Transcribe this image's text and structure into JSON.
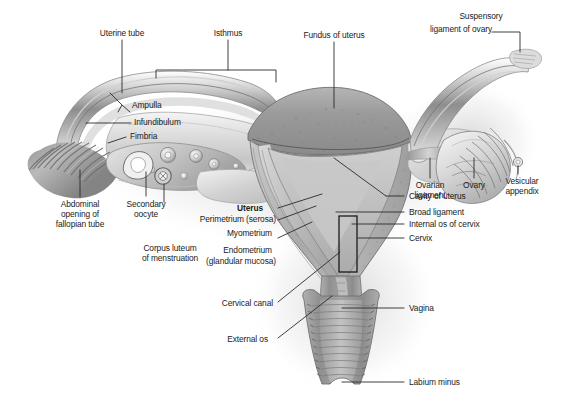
{
  "figure": {
    "background_color": "#ffffff",
    "text_color": "#1b1b1b",
    "leader_line_color": "#2a2a2a",
    "width": 563,
    "height": 401
  },
  "labels": {
    "uterine_tube": "Uterine tube",
    "isthmus": "Isthmus",
    "fundus_of_uterus": "Fundus of uterus",
    "suspensory_ligament_of_ovary_l1": "Suspensory",
    "suspensory_ligament_of_ovary_l2": "ligament of ovary",
    "ampulla": "Ampulla",
    "infundibulum": "Infundibulum",
    "fimbria": "Fimbria",
    "ovarian_ligament_l1": "Ovarian",
    "ovarian_ligament_l2": "ligament",
    "ovary": "Ovary",
    "vesicular_appendix_l1": "Vesicular",
    "vesicular_appendix_l2": "appendix",
    "abdominal_opening_l1": "Abdominal",
    "abdominal_opening_l2": "opening of",
    "abdominal_opening_l3": "fallopian tube",
    "secondary_oocyte_l1": "Secondary",
    "secondary_oocyte_l2": "oocyte",
    "corpus_luteum_l1": "Corpus luteum",
    "corpus_luteum_l2": "of menstruation",
    "uterus": "Uterus",
    "perimetrium": "Perimetrium (serosa)",
    "myometrium": "Myometrium",
    "endometrium_l1": "Endometrium",
    "endometrium_l2": "(glandular mucosa)",
    "cavity_of_uterus": "Cavity of uterus",
    "broad_ligament": "Broad ligament",
    "internal_os_of_cervix": "Internal os of cervix",
    "cervix": "Cervix",
    "cervical_canal": "Cervical canal",
    "external_os": "External os",
    "vagina": "Vagina",
    "labium_minus": "Labium minus"
  },
  "structures": [
    {
      "name": "left-fallopian-tube",
      "label_ref": "uterine_tube"
    },
    {
      "name": "left-tube-isthmus",
      "label_ref": "isthmus"
    },
    {
      "name": "uterine-fundus",
      "label_ref": "fundus_of_uterus"
    },
    {
      "name": "suspensory-ligament-of-ovary",
      "label_ref": "suspensory_ligament_of_ovary_l1"
    },
    {
      "name": "ampulla-of-tube",
      "label_ref": "ampulla"
    },
    {
      "name": "infundibulum-of-tube",
      "label_ref": "infundibulum"
    },
    {
      "name": "fimbriae",
      "label_ref": "fimbria"
    },
    {
      "name": "ovarian-ligament",
      "label_ref": "ovarian_ligament_l1"
    },
    {
      "name": "right-ovary",
      "label_ref": "ovary"
    },
    {
      "name": "vesicular-appendix",
      "label_ref": "vesicular_appendix_l1"
    },
    {
      "name": "abdominal-opening-of-fallopian-tube",
      "label_ref": "abdominal_opening_l1"
    },
    {
      "name": "secondary-oocyte",
      "label_ref": "secondary_oocyte_l1"
    },
    {
      "name": "corpus-luteum-of-menstruation",
      "label_ref": "corpus_luteum_l1"
    },
    {
      "name": "perimetrium-serosa",
      "label_ref": "perimetrium"
    },
    {
      "name": "myometrium",
      "label_ref": "myometrium"
    },
    {
      "name": "endometrium",
      "label_ref": "endometrium_l1"
    },
    {
      "name": "uterine-cavity",
      "label_ref": "cavity_of_uterus"
    },
    {
      "name": "broad-ligament",
      "label_ref": "broad_ligament"
    },
    {
      "name": "internal-os-of-cervix",
      "label_ref": "internal_os_of_cervix"
    },
    {
      "name": "cervix",
      "label_ref": "cervix"
    },
    {
      "name": "cervical-canal",
      "label_ref": "cervical_canal"
    },
    {
      "name": "external-os",
      "label_ref": "external_os"
    },
    {
      "name": "vagina",
      "label_ref": "vagina"
    },
    {
      "name": "labium-minus",
      "label_ref": "labium_minus"
    }
  ]
}
